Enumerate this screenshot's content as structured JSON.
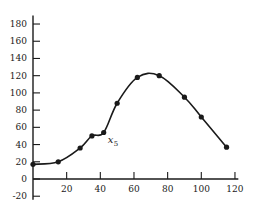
{
  "chart_data": {
    "type": "line",
    "title": "",
    "xlabel": "",
    "ylabel": "",
    "xlim": [
      0,
      120
    ],
    "ylim": [
      -20,
      190
    ],
    "grid": false,
    "x_ticks": [
      20,
      40,
      60,
      80,
      100,
      120
    ],
    "y_ticks": [
      -20,
      0,
      20,
      40,
      60,
      80,
      100,
      120,
      140,
      160,
      180
    ],
    "series": [
      {
        "name": "data",
        "points": [
          {
            "x": 0,
            "y": 17
          },
          {
            "x": 15,
            "y": 20
          },
          {
            "x": 28,
            "y": 36
          },
          {
            "x": 35,
            "y": 50
          },
          {
            "x": 42,
            "y": 54
          },
          {
            "x": 50,
            "y": 88
          },
          {
            "x": 62,
            "y": 118
          },
          {
            "x": 75,
            "y": 120
          },
          {
            "x": 90,
            "y": 95
          },
          {
            "x": 100,
            "y": 72
          },
          {
            "x": 115,
            "y": 37
          }
        ],
        "curve": "smooth"
      }
    ],
    "annotations": [
      {
        "text": "x",
        "subscript": "5",
        "at_point_index": 4
      }
    ]
  },
  "colors": {
    "ink": "#1a1a1a",
    "background": "#ffffff"
  }
}
